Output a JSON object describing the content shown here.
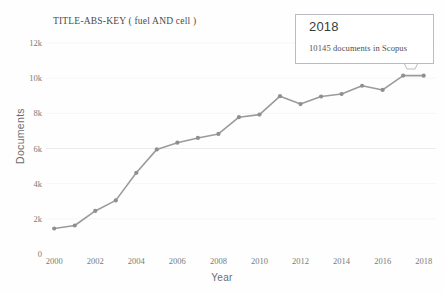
{
  "chart_data": {
    "type": "line",
    "title": "TITLE-ABS-KEY ( fuel  AND cell )",
    "xlabel": "Year",
    "ylabel": "Documents",
    "x": [
      2000,
      2001,
      2002,
      2003,
      2004,
      2005,
      2006,
      2007,
      2008,
      2009,
      2010,
      2011,
      2012,
      2013,
      2014,
      2015,
      2016,
      2017,
      2018
    ],
    "values": [
      1450,
      1620,
      2450,
      3050,
      4620,
      5950,
      6330,
      6600,
      6830,
      7780,
      7930,
      8980,
      8530,
      8960,
      9100,
      9570,
      9330,
      10150,
      10145
    ],
    "xtick_labels": [
      "2000",
      "2002",
      "2004",
      "2006",
      "2008",
      "2010",
      "2012",
      "2014",
      "2016",
      "2018"
    ],
    "xticks": [
      2000,
      2002,
      2004,
      2006,
      2008,
      2010,
      2012,
      2014,
      2016,
      2018
    ],
    "ytick_labels": [
      "0",
      "2k",
      "4k",
      "6k",
      "8k",
      "10k",
      "12k"
    ],
    "yticks": [
      0,
      2000,
      4000,
      6000,
      8000,
      10000,
      12000
    ],
    "xlim": [
      1999.6,
      2018.6
    ],
    "ylim": [
      0,
      12400
    ],
    "grid": "faint-horizontal",
    "legend": "none",
    "series_color": "#9b9b9b",
    "marker_color": "#8f8f8f",
    "text_color": "#7a7a7a"
  },
  "tooltip": {
    "year": "2018",
    "count_text": "10145 documents in Scopus",
    "border_color": "#b9bcc0"
  }
}
